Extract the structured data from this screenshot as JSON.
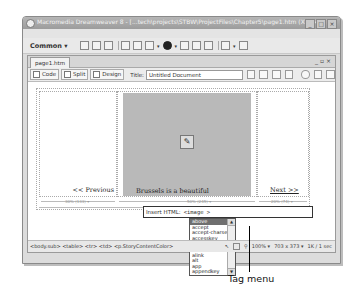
{
  "window": {
    "title": "Macromedia Dreamweaver 8 - [...tech\\projects\\STBW\\ProjectFiles\\Chapter5\\page1.htm (XHTML)]",
    "controls": [
      "minimize",
      "maximize",
      "close"
    ]
  },
  "menubar": {
    "items": [
      "File",
      "Edit",
      "View",
      "Insert",
      "Modify",
      "Text",
      "Commands",
      "Site",
      "Window",
      "Help"
    ]
  },
  "insert_bar": {
    "category": "Common",
    "icons": [
      "hyperlink-icon",
      "email-link-icon",
      "named-anchor-icon",
      "table-icon",
      "div-icon",
      "image-icon",
      "media-icon",
      "date-icon",
      "server-include-icon",
      "comment-icon",
      "head-icon",
      "template-icon",
      "tag-chooser-icon"
    ]
  },
  "document": {
    "tab": "page1.htm",
    "window_controls": [
      "minimize",
      "restore",
      "close"
    ],
    "view_buttons": {
      "code": "Code",
      "split": "Split",
      "design": "Design"
    },
    "title_label": "Title:",
    "title_value": "Untitled Document"
  },
  "canvas": {
    "prev_link": "<< Previous",
    "caption": "Brussels is a beautiful",
    "next_link": "Next >>",
    "widths": {
      "left": "30% (133) ▾",
      "mid": "50% (245) ▾",
      "right": "20% (74) ▾",
      "table": "100% (644) ▾"
    }
  },
  "insert_html": {
    "label": "Insert HTML:",
    "value": "<image >"
  },
  "tag_menu": {
    "items": [
      "above",
      "accept",
      "accept-charset",
      "accesskey",
      "action",
      "align",
      "alink",
      "alt",
      "app",
      "appendkey"
    ],
    "selected_index": 0
  },
  "status_bar": {
    "tag_selector": "<body.sub> <table> <tr> <td> <p.StoryContentColor>",
    "zoom": "100%",
    "dimensions": "703 x 373",
    "download": "1K / 1 sec"
  },
  "callout": {
    "label": "Tag menu"
  }
}
